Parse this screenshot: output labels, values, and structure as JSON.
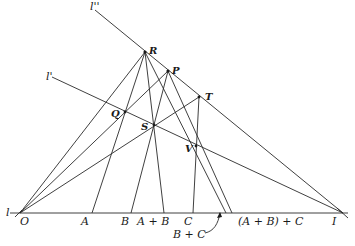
{
  "diagram": {
    "type": "projective geometry construction (addition of points on a line)",
    "lines": [
      "l",
      "l'",
      "l''"
    ],
    "points": [
      "R",
      "P",
      "T",
      "Q",
      "S",
      "V",
      "O",
      "A",
      "B",
      "C",
      "I"
    ],
    "axis_labels": {
      "l": "l",
      "O": "O",
      "A": "A",
      "B": "B",
      "AplusB": "A + B",
      "C": "C",
      "BplusC": "B + C",
      "AplusBplusC": "(A + B) + C",
      "I": "I"
    },
    "line_labels": {
      "l_prime": "l'",
      "l_double_prime": "l''"
    },
    "point_labels": {
      "R": "R",
      "P": "P",
      "T": "T",
      "Q": "Q",
      "S": "S",
      "V": "V"
    }
  }
}
